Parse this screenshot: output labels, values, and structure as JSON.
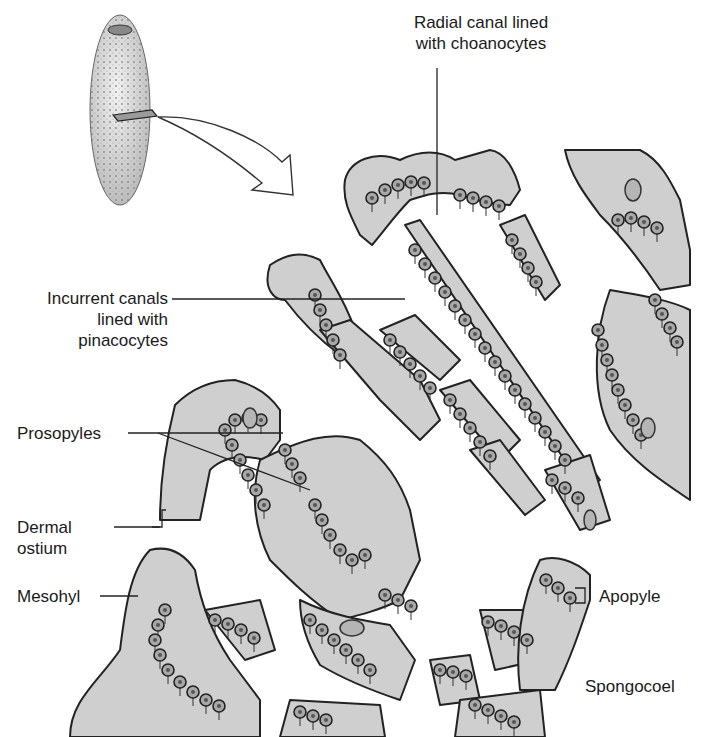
{
  "diagram": {
    "labels": {
      "radial_canal": {
        "line1": "Radial canal lined",
        "line2": "with choanocytes"
      },
      "incurrent_canals": {
        "line1": "Incurrent canals",
        "line2": "lined with",
        "line3": "pinacocytes"
      },
      "prosopyles": "Prosopyles",
      "dermal_ostium": {
        "line1": "Dermal",
        "line2": "ostium"
      },
      "mesohyl": "Mesohyl",
      "apopyle": "Apopyle",
      "spongocoel": "Spongocoel"
    },
    "colors": {
      "tissue_fill": "#cfcfcf",
      "outline": "#222222",
      "choanocyte_fill": "#a8a8a8",
      "background": "#ffffff",
      "text": "#1a1a1a"
    }
  }
}
